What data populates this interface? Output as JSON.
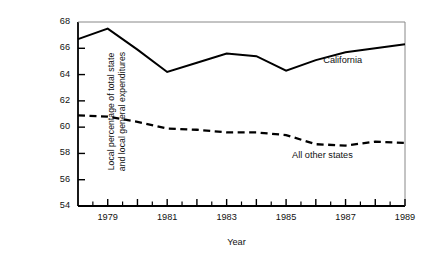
{
  "chart_data": {
    "type": "line",
    "title": "",
    "xlabel": "Year",
    "ylabel": "Local percentage of total state and local general expenditures",
    "ylabel_line1": "Local percentage of total state",
    "ylabel_line2": "and local general expenditures",
    "x": [
      1978,
      1979,
      1980,
      1981,
      1982,
      1983,
      1984,
      1985,
      1986,
      1987,
      1988,
      1989
    ],
    "xlim": [
      1978,
      1989
    ],
    "ylim": [
      54,
      68
    ],
    "yticks": [
      54,
      56,
      58,
      60,
      62,
      64,
      66,
      68
    ],
    "ytick_labels": [
      "54",
      "56",
      "58",
      "60",
      "62",
      "64",
      "66",
      "68"
    ],
    "xticks": [
      1979,
      1980,
      1981,
      1982,
      1983,
      1984,
      1985,
      1986,
      1987,
      1988,
      1989
    ],
    "xtick_labels_shown": [
      "1979",
      "1981",
      "1983",
      "1985",
      "1987",
      "1989"
    ],
    "xtick_label_years": [
      1979,
      1981,
      1983,
      1985,
      1987,
      1989
    ],
    "grid": false,
    "legend": "inline-annotations",
    "series": [
      {
        "name": "California",
        "style": "solid",
        "color": "#000000",
        "values": [
          66.7,
          67.5,
          65.9,
          64.2,
          64.9,
          65.6,
          65.4,
          64.3,
          65.1,
          65.7,
          66.0,
          66.3
        ],
        "label": "California",
        "label_x": 1986.25,
        "label_y": 65.0
      },
      {
        "name": "All other states",
        "style": "dashed",
        "color": "#000000",
        "values": [
          60.9,
          60.8,
          60.4,
          59.9,
          59.8,
          59.6,
          59.6,
          59.4,
          58.7,
          58.6,
          58.9,
          58.8
        ],
        "label": "All other states",
        "label_x": 1985.2,
        "label_y": 57.8
      }
    ]
  },
  "axes": {
    "axis_color": "#000000",
    "tick_color": "#000000",
    "top_spine_color": "#888888",
    "right_spine_color": "#888888"
  }
}
